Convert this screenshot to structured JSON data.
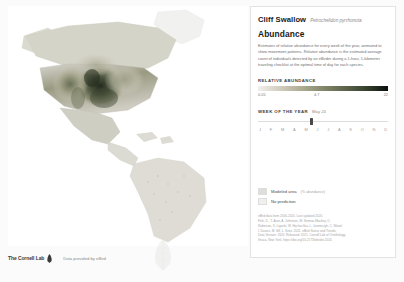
{
  "species": {
    "common_name": "Cliff Swallow",
    "scientific_name": "Petrochelidon pyrrhonota"
  },
  "section": {
    "title": "Abundance",
    "description": "Estimates of relative abundance for every week of the year, animated to show movement patterns. Relative abundance is the estimated average count of individuals detected by an eBirder during a 1-hour, 1-kilometer traveling checklist at the optimal time of day for each species."
  },
  "relative_abundance": {
    "header": "RELATIVE ABUNDANCE",
    "ticks": {
      "low": "0.05",
      "mid": "4.7",
      "high": "22"
    }
  },
  "week_of_year": {
    "header": "WEEK OF THE YEAR",
    "value": "May 24",
    "months": [
      "J",
      "F",
      "M",
      "A",
      "M",
      "J",
      "J",
      "A",
      "S",
      "O",
      "N",
      "D"
    ],
    "thumb_percent": 40
  },
  "map_keys": [
    {
      "label": "Modeled area",
      "sub": "(% abundance)",
      "swatch": "#dfdedb",
      "name": "modeled-area"
    },
    {
      "label": "No prediction",
      "sub": "",
      "swatch": "#f0f0ee",
      "name": "no-prediction"
    }
  ],
  "citation": {
    "line1": "eBird data from 2006-2020. Last updated 2020.",
    "line2": "Fink, D., T. Auer, A. Johnston, M. Strimas-Mackey, O.",
    "line3": "Robinson, S. Ligocki, W. Hochachka, L. Jaromczyk, C. Wood,",
    "line4": "I. Davies, M. Iliff, L. Seitz. 2021. eBird Status and Trends,",
    "line5": "Data Version: 2020; Released: 2021. Cornell Lab of Ornithology,",
    "line6": "Ithaca, New York. https://doi.org/10.2173/ebirdst.2020"
  },
  "footer": {
    "logo_text": "The Cornell Lab",
    "credit": "Data provided by eBird"
  },
  "colors": {
    "gradient_low": "#f2f0ee",
    "gradient_high": "#0b0f0b",
    "modeled_area": "#dfdedb",
    "panel_border": "#e3e3e3"
  },
  "chart_data": {
    "type": "heatmap",
    "value_range": [
      0.05,
      22
    ],
    "colorbar_ticks": [
      0.05,
      4.7,
      22
    ],
    "regions": [
      {
        "name": "Great Plains USA",
        "abundance": 22
      },
      {
        "name": "Western USA",
        "abundance": 12
      },
      {
        "name": "Midwest USA",
        "abundance": 9
      },
      {
        "name": "Southern Canada",
        "abundance": 6
      },
      {
        "name": "Eastern USA",
        "abundance": 4
      },
      {
        "name": "Mexico",
        "abundance": 1.5
      },
      {
        "name": "Central America",
        "abundance": 0.3
      },
      {
        "name": "South America",
        "abundance": 0.05
      }
    ]
  }
}
